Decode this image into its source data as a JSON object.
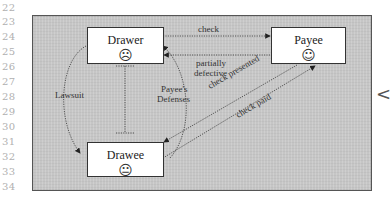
{
  "line_numbers": [
    "22",
    "23",
    "24",
    "25",
    "26",
    "27",
    "28",
    "29",
    "30",
    "31",
    "32",
    "33",
    "34"
  ],
  "diagram": {
    "nodes": {
      "drawer": {
        "label": "Drawer",
        "face": "☹",
        "face_meaning": "frowning"
      },
      "payee": {
        "label": "Payee",
        "face": "☺",
        "face_meaning": "smiling"
      },
      "drawee": {
        "label": "Drawee",
        "face": "😐",
        "face_meaning": "neutral"
      }
    },
    "edges": {
      "check": "check",
      "partially_defective": [
        "partially",
        "defective"
      ],
      "lawsuit": "Lawsuit",
      "payees_defenses": [
        "Payee's",
        "Defenses"
      ],
      "check_presented": "check presented",
      "check_paid": "check paid"
    }
  },
  "side_marker": "<",
  "colors": {
    "panel": "#c9c9c9",
    "box": "#ffffff",
    "stroke": "#333333"
  }
}
